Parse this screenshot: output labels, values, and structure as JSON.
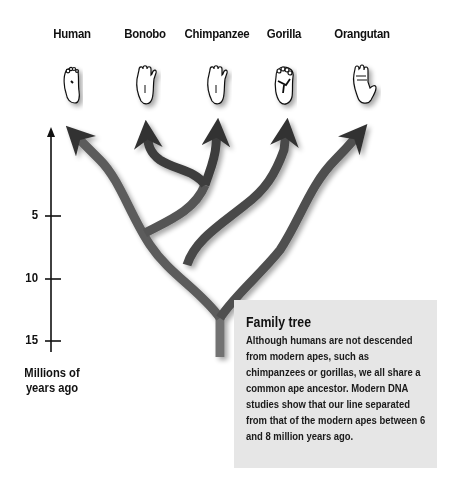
{
  "species": [
    {
      "name": "Human",
      "x": 72,
      "foot": "human-foot"
    },
    {
      "name": "Bonobo",
      "x": 145,
      "foot": "bonobo-foot"
    },
    {
      "name": "Chimpanzee",
      "x": 217,
      "foot": "chimpanzee-foot"
    },
    {
      "name": "Gorilla",
      "x": 285,
      "foot": "gorilla-foot"
    },
    {
      "name": "Orangutan",
      "x": 362,
      "foot": "orangutan-foot"
    }
  ],
  "axis": {
    "title_line1": "Millions of",
    "title_line2": "years ago",
    "ticks": [
      {
        "label": "5",
        "y": 216
      },
      {
        "label": "10",
        "y": 279
      },
      {
        "label": "15",
        "y": 341
      }
    ]
  },
  "info_box": {
    "title": "Family tree",
    "body": "Although humans are not descended from modern apes, such as chimpanzees or gorillas, we all share a common ape ancestor. Modern DNA studies show that our line separated from that of the modern apes between 6 and 8 million years ago."
  },
  "colors": {
    "branch_dark": "#3a3a3a",
    "branch_light": "#6e6e6e",
    "box_bg": "#e6e6e6",
    "text": "#111111"
  }
}
